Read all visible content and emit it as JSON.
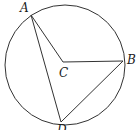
{
  "diagram": {
    "type": "circle-geometry",
    "circle": {
      "center": "C",
      "cx": 65,
      "cy": 65,
      "r": 60
    },
    "points": [
      {
        "id": "A",
        "label": "A",
        "x": 31,
        "y": 15,
        "lx": 20,
        "ly": 12
      },
      {
        "id": "B",
        "label": "B",
        "x": 123,
        "y": 61,
        "lx": 127,
        "ly": 64
      },
      {
        "id": "C",
        "label": "C",
        "x": 63,
        "y": 62,
        "lx": 59,
        "ly": 77
      },
      {
        "id": "D",
        "label": "D",
        "x": 61,
        "y": 122,
        "lx": 57,
        "ly": 134
      }
    ],
    "segments": [
      {
        "from": "A",
        "to": "C"
      },
      {
        "from": "C",
        "to": "B"
      },
      {
        "from": "A",
        "to": "D"
      },
      {
        "from": "B",
        "to": "D"
      }
    ],
    "colors": {
      "line": "#333333",
      "label": "#1a1a1a",
      "background": "#ffffff"
    }
  }
}
